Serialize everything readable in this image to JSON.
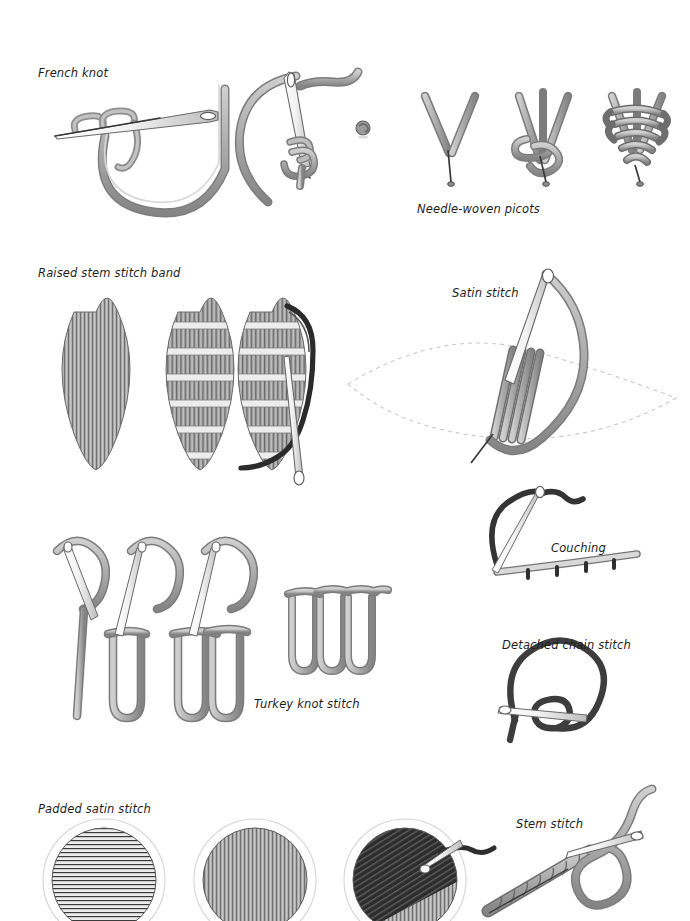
{
  "page": {
    "background": "#ffffff",
    "width": 690,
    "height": 921
  },
  "palette": {
    "thread_light": "#b8b8b8",
    "thread_mid": "#9a9a9a",
    "thread_dark": "#7d7d7d",
    "thread_outline": "#4f4f4f",
    "thread_black": "#3a3a3a",
    "needle_fill": "#fbfbfb",
    "needle_outline": "#6a6a6a",
    "guide_dash": "#c9c9c9",
    "text": "#1d1d1d",
    "fill_dark_block": "#2f2f2f",
    "fill_grey_block": "#8d8d8d"
  },
  "labels": [
    {
      "id": "french-knot",
      "text": "French knot",
      "x": 38,
      "y": 66
    },
    {
      "id": "needle-woven-picots",
      "text": "Needle-woven picots",
      "x": 417,
      "y": 202
    },
    {
      "id": "raised-stem-stitch",
      "text": "Raised stem stitch band",
      "x": 38,
      "y": 266
    },
    {
      "id": "satin-stitch",
      "text": "Satin stitch",
      "x": 452,
      "y": 286
    },
    {
      "id": "couching",
      "text": "Couching",
      "x": 551,
      "y": 541
    },
    {
      "id": "detached-chain",
      "text": "Detached chain stitch",
      "x": 502,
      "y": 638
    },
    {
      "id": "turkey-knot",
      "text": "Turkey knot stitch",
      "x": 254,
      "y": 697
    },
    {
      "id": "padded-satin",
      "text": "Padded satin stitch",
      "x": 38,
      "y": 802
    },
    {
      "id": "stem-stitch",
      "text": "Stem stitch",
      "x": 516,
      "y": 817
    }
  ],
  "figures": [
    {
      "id": "french-knot",
      "label_ref": "french-knot",
      "steps": [
        {
          "name": "thread-wrapped-on-needle",
          "desc": "needle held horizontally with thread wrapped twice around shaft, long loop of thread below"
        },
        {
          "name": "needle-pulled-through",
          "desc": "needle vertical, thread coiled at needle tip, loop pulled to fabric"
        },
        {
          "name": "finished-knot",
          "desc": "small completed round knot"
        }
      ]
    },
    {
      "id": "needle-woven-picots",
      "label_ref": "needle-woven-picots",
      "steps": [
        {
          "name": "two-anchor-threads",
          "desc": "V shaped pair of threads anchored at a point"
        },
        {
          "name": "weaving-begun",
          "desc": "third thread starting to weave across the V"
        },
        {
          "name": "woven-picot-complete",
          "desc": "fully woven triangular picot"
        }
      ]
    },
    {
      "id": "raised-stem-stitch-band",
      "label_ref": "raised-stem-stitch",
      "steps": [
        {
          "name": "padding-laid",
          "desc": "leaf shape filled with vertical padding stitches"
        },
        {
          "name": "bars-laid",
          "desc": "horizontal bars laid across the padded leaf"
        },
        {
          "name": "stem-stitch-worked",
          "desc": "needle and dark thread working stem stitch over the bars"
        }
      ]
    },
    {
      "id": "satin-stitch",
      "label_ref": "satin-stitch",
      "steps": [
        {
          "name": "outline-and-first-stitches",
          "desc": "dashed leaf outline with several satin stitches laid and needle entering fabric"
        }
      ]
    },
    {
      "id": "couching",
      "label_ref": "couching",
      "steps": [
        {
          "name": "laid-thread-tied-down",
          "desc": "pale laid thread tied down by small dark couching stitches, dark working thread and needle above"
        }
      ]
    },
    {
      "id": "detached-chain-stitch",
      "label_ref": "detached-chain",
      "steps": [
        {
          "name": "loop-and-anchor",
          "desc": "dark thread loop held by needle passing through the base of the loop"
        }
      ]
    },
    {
      "id": "turkey-knot-stitch",
      "label_ref": "turkey-knot",
      "steps": [
        {
          "name": "first-tail",
          "desc": "needle entering fabric leaving a tail of thread"
        },
        {
          "name": "first-loop",
          "desc": "loop formed with backstitch over it"
        },
        {
          "name": "second-loop",
          "desc": "second loop added beside the first"
        },
        {
          "name": "row-of-loops",
          "desc": "finished row of six even loops"
        }
      ]
    },
    {
      "id": "padded-satin-stitch",
      "label_ref": "padded-satin",
      "steps": [
        {
          "name": "horizontal-padding",
          "desc": "circle filled with horizontal padding stitches inside faint outline"
        },
        {
          "name": "vertical-padding",
          "desc": "circle filled with vertical stitches over the padding"
        },
        {
          "name": "final-layer-in-work",
          "desc": "circle half covered by dark diagonal satin layer with needle and dark thread at work"
        }
      ]
    },
    {
      "id": "stem-stitch",
      "label_ref": "stem-stitch",
      "steps": [
        {
          "name": "rope-line-and-needle",
          "desc": "completed twisted rope-like line of stem stitch with needle taking the next stitch"
        }
      ]
    }
  ]
}
